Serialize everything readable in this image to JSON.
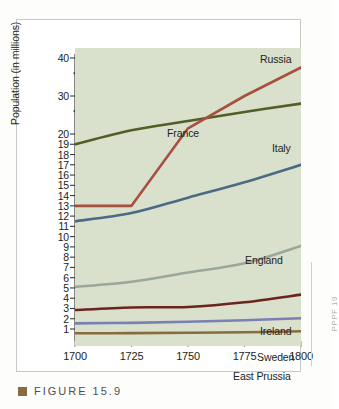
{
  "figure": {
    "caption_label": "FIGURE 15.9",
    "bullet_color": "#8a6b3d",
    "margin_note": "PPPF 19"
  },
  "chart_data": {
    "type": "line",
    "title": "",
    "xlabel": "",
    "ylabel": "Population (in millions)",
    "grid": false,
    "legend_position": "inline-labels",
    "xlim": [
      1700,
      1800
    ],
    "xticks": [
      1700,
      1725,
      1750,
      1775,
      1800
    ],
    "yticks": [
      1,
      2,
      3,
      4,
      5,
      6,
      7,
      8,
      9,
      10,
      11,
      12,
      13,
      14,
      15,
      16,
      17,
      18,
      19,
      20,
      30,
      40
    ],
    "ylim": [
      0,
      40
    ],
    "y_axis_broken": true,
    "y_axis_break_note": "Scale compressed above 20; breaks drawn between 20-30 and 30-40",
    "plot_background": "#d9e0cb",
    "x": [
      1700,
      1725,
      1750,
      1775,
      1800
    ],
    "series": [
      {
        "name": "Russia",
        "color": "#545c27",
        "values": [
          19.0,
          21.0,
          23.4,
          25.8,
          28.0
        ],
        "label_x": 243,
        "label_y": 33
      },
      {
        "name": "France",
        "color": "#a8503f",
        "values": [
          13.0,
          13.0,
          21.5,
          30.0,
          37.5
        ],
        "label_x": 150,
        "label_y": 107
      },
      {
        "name": "Italy",
        "color": "#4a6b85",
        "values": [
          11.5,
          12.3,
          13.8,
          15.3,
          17.0
        ],
        "label_x": 255,
        "label_y": 122
      },
      {
        "name": "England",
        "color": "#9aa89a",
        "values": [
          5.1,
          5.6,
          6.5,
          7.4,
          9.1
        ],
        "label_x": 228,
        "label_y": 234
      },
      {
        "name": "Ireland",
        "color": "#6b2420",
        "values": [
          2.85,
          3.1,
          3.15,
          3.6,
          4.35
        ],
        "label_x": 243,
        "label_y": 305
      },
      {
        "name": "Sweden",
        "color": "#7b7fb5",
        "values": [
          1.55,
          1.6,
          1.7,
          1.85,
          2.05
        ],
        "label_x": 240,
        "label_y": 331
      },
      {
        "name": "East Prussia",
        "color": "#8a6b3d",
        "values": [
          0.58,
          0.6,
          0.63,
          0.68,
          0.78
        ],
        "label_x": 216,
        "label_y": 350
      }
    ]
  }
}
